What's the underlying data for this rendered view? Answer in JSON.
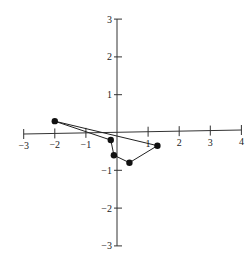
{
  "chart_data": {
    "type": "line",
    "title": "",
    "xlabel": "",
    "ylabel": "",
    "xlim": [
      -3,
      4
    ],
    "ylim": [
      -3,
      3
    ],
    "grid": false,
    "legend": null,
    "x_ticks": [
      -3,
      -2,
      -1,
      1,
      2,
      3,
      4
    ],
    "x_tick_labels": [
      "−3",
      "−2",
      "−1",
      "1",
      "2",
      "3",
      "4"
    ],
    "y_ticks": [
      3,
      2,
      1,
      -1,
      -2,
      -3
    ],
    "y_tick_labels": [
      "3",
      "2",
      "1",
      "−1",
      "−2",
      "−3"
    ],
    "closed": true,
    "series": [
      {
        "name": "polygon",
        "points": [
          {
            "x": -2.0,
            "y": 0.3
          },
          {
            "x": -0.2,
            "y": -0.2
          },
          {
            "x": -0.1,
            "y": -0.6
          },
          {
            "x": 0.4,
            "y": -0.8
          },
          {
            "x": 1.3,
            "y": -0.35
          }
        ]
      }
    ]
  }
}
